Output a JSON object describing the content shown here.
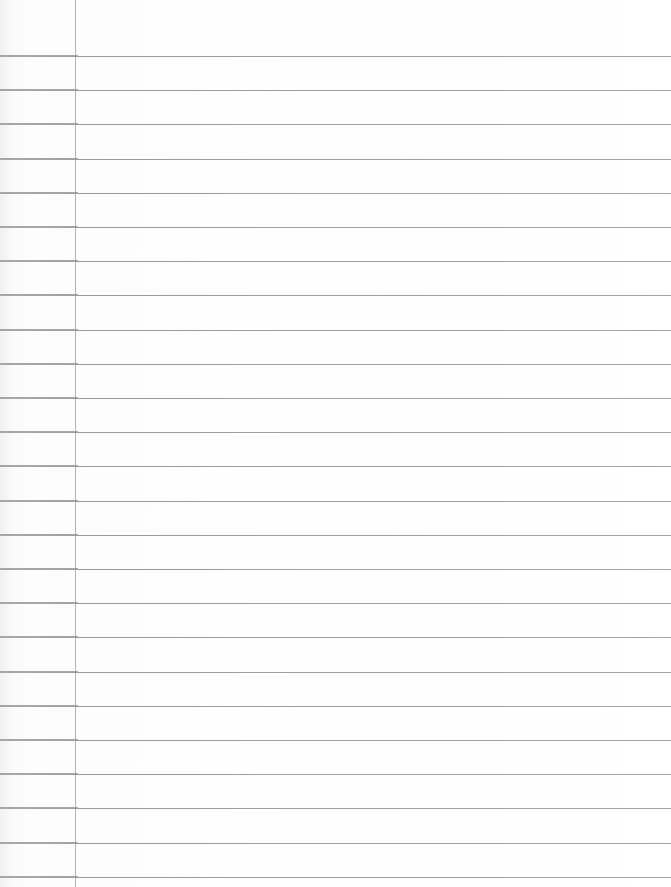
{
  "page": {
    "type": "blank lined notebook paper",
    "background_color": "#fdfdfd",
    "rule_color": "#8e8e8e",
    "margin_line_color": "#b4b4b4",
    "margin_line_x": 75,
    "first_rule_y": 56,
    "rule_spacing": 34.2,
    "rule_count": 25
  }
}
